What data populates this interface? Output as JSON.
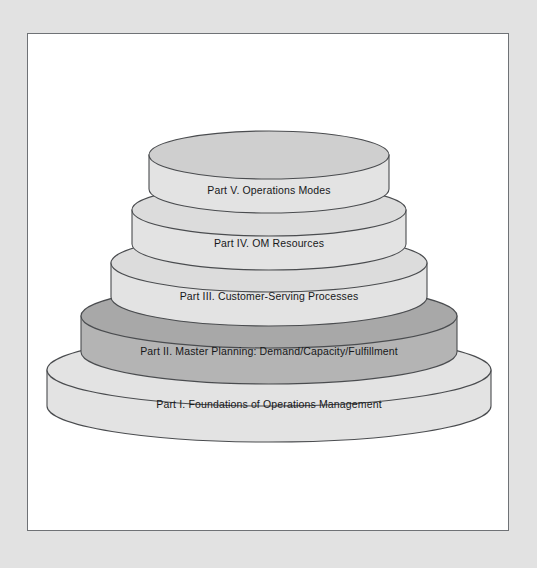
{
  "figure": {
    "type": "layered-cylinder-stack-diagram",
    "title_visible": false,
    "background_color": "#e2e2e2",
    "canvas_color": "#ffffff",
    "border_color": "#6f7276"
  },
  "palette": {
    "tier_light_face": "#e3e3e3",
    "tier_light_top": "#cfcfcf",
    "tier_dark_face": "#b4b4b4",
    "tier_dark_top": "#a0a0a0",
    "outline": "#4a4c4f",
    "text": "#17181a"
  },
  "tiers": [
    {
      "id": "tier-v",
      "label": "Part V. Operations Modes",
      "level": 5,
      "position_from_top": 1,
      "shade": "light",
      "face_color": "#e3e3e3",
      "top_color": "#cfcfcf"
    },
    {
      "id": "tier-iv",
      "label": "Part IV. OM Resources",
      "level": 4,
      "position_from_top": 2,
      "shade": "light",
      "face_color": "#e3e3e3",
      "top_color": "#cfcfcf"
    },
    {
      "id": "tier-iii",
      "label": "Part III. Customer-Serving Processes",
      "level": 3,
      "position_from_top": 3,
      "shade": "light",
      "face_color": "#e3e3e3",
      "top_color": "#cfcfcf"
    },
    {
      "id": "tier-ii",
      "label": "Part II. Master Planning: Demand/Capacity/Fulfillment",
      "level": 2,
      "position_from_top": 4,
      "shade": "dark",
      "face_color": "#b4b4b4",
      "top_color": "#a0a0a0"
    },
    {
      "id": "tier-i",
      "label": "Part I. Foundations of Operations Management",
      "level": 1,
      "position_from_top": 5,
      "shade": "light",
      "face_color": "#e3e3e3",
      "top_color": "#cfcfcf"
    }
  ]
}
